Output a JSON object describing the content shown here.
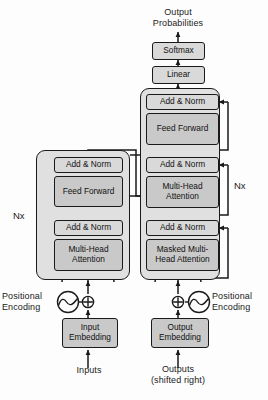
{
  "figure": {
    "background": "#fdfdfd",
    "outer_block_fill": "#e0e0e0",
    "inner_block_fill": "#c9c9c9",
    "addnorm_fill": "#d9d9d9",
    "stroke": "#1a1a1a"
  },
  "labels": {
    "output_probabilities": "Output\nProbabilities",
    "inputs": "Inputs",
    "outputs": "Outputs\n(shifted right)",
    "positional_encoding_left": "Positional\nEncoding",
    "positional_encoding_right": "Positional\nEncoding",
    "encoder_repeat": "Nx",
    "decoder_repeat": "Nx"
  },
  "blocks": {
    "softmax": "Softmax",
    "linear": "Linear",
    "add_norm": "Add & Norm",
    "feed_forward": "Feed\nForward",
    "multi_head_attention": "Multi-Head\nAttention",
    "masked_multi_head_attention": "Masked\nMulti-Head\nAttention",
    "input_embedding": "Input\nEmbedding",
    "output_embedding": "Output\nEmbedding"
  },
  "encoder_stack": [
    {
      "id": "enc-add-norm-2",
      "label": "Add & Norm",
      "kind": "add-norm"
    },
    {
      "id": "enc-feed-forward",
      "label": "Feed\nForward",
      "kind": "sublayer"
    },
    {
      "id": "enc-add-norm-1",
      "label": "Add & Norm",
      "kind": "add-norm"
    },
    {
      "id": "enc-multi-head-attention",
      "label": "Multi-Head\nAttention",
      "kind": "sublayer"
    }
  ],
  "decoder_stack": [
    {
      "id": "dec-add-norm-3",
      "label": "Add & Norm",
      "kind": "add-norm"
    },
    {
      "id": "dec-feed-forward",
      "label": "Feed\nForward",
      "kind": "sublayer"
    },
    {
      "id": "dec-add-norm-2",
      "label": "Add & Norm",
      "kind": "add-norm"
    },
    {
      "id": "dec-multi-head-attention",
      "label": "Multi-Head\nAttention",
      "kind": "sublayer"
    },
    {
      "id": "dec-add-norm-1",
      "label": "Add & Norm",
      "kind": "add-norm"
    },
    {
      "id": "dec-masked-multi-head-attention",
      "label": "Masked\nMulti-Head\nAttention",
      "kind": "sublayer"
    }
  ],
  "icons": {
    "sum_left": "⊕",
    "sum_right": "⊕",
    "sine_left": "sine-wave-icon",
    "sine_right": "sine-wave-icon"
  }
}
